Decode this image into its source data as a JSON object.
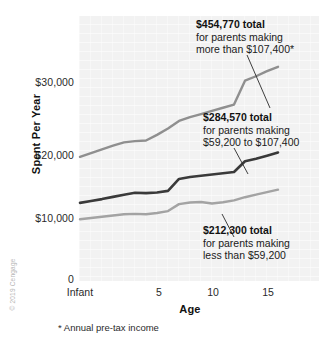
{
  "chart_data": {
    "type": "line",
    "title": "",
    "xlabel": "Age",
    "ylabel": "Spent Per Year",
    "xlim": [
      0,
      18
    ],
    "ylim": [
      0,
      36000
    ],
    "grid": false,
    "legend_position": "inline-annotations",
    "x_tick_labels": [
      "Infant",
      "5",
      "10",
      "15"
    ],
    "x_tick_values": [
      0,
      5,
      10,
      15
    ],
    "y_tick_labels": [
      "0",
      "$10,000",
      "$20,000",
      "$30,000"
    ],
    "y_tick_values": [
      0,
      10000,
      20000,
      30000
    ],
    "x": [
      0,
      1,
      2,
      3,
      4,
      5,
      6,
      7,
      8,
      9,
      10,
      11,
      12,
      13,
      14,
      15,
      16,
      17,
      18
    ],
    "series": [
      {
        "name": "more than $107,400",
        "total": "$454,770",
        "color": "#8f8f8f",
        "values": [
          19700,
          20300,
          20900,
          21500,
          22000,
          22200,
          22300,
          23200,
          24200,
          25400,
          26000,
          26500,
          27000,
          27500,
          28000,
          31800,
          32500,
          33300,
          34000
        ]
      },
      {
        "name": "$59,200 to $107,400",
        "total": "$284,570",
        "color": "#3a3a3a",
        "values": [
          12400,
          12700,
          13000,
          13350,
          13700,
          14000,
          13950,
          14050,
          14300,
          16200,
          16500,
          16700,
          16900,
          17100,
          17300,
          19000,
          19400,
          19900,
          20400
        ]
      },
      {
        "name": "less than $59,200",
        "total": "$212,300",
        "color": "#a3a3a3",
        "values": [
          9800,
          10000,
          10200,
          10400,
          10600,
          10650,
          10600,
          10800,
          11100,
          12200,
          12450,
          12550,
          12300,
          12500,
          12800,
          13300,
          13700,
          14100,
          14500
        ]
      }
    ],
    "annotations": [
      {
        "id": "high-income",
        "headline": "$454,770 total",
        "line2": "for parents making",
        "line3": "more than $107,400*"
      },
      {
        "id": "mid-income",
        "headline": "$284,570 total",
        "line2": "for parents making",
        "line3": "$59,200 to $107,400"
      },
      {
        "id": "low-income",
        "headline": "$212,300 total",
        "line2": "for parents making",
        "line3": "less than $59,200"
      }
    ],
    "footnote": "* Annual pre-tax income",
    "credit": "© 2019 Cengage"
  }
}
